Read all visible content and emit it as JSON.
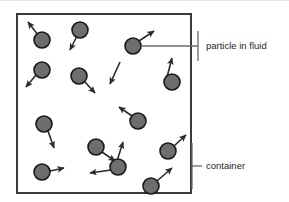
{
  "figure": {
    "colors": {
      "container_stroke": "#3a3a3a",
      "particle_fill": "#6e6e6e",
      "particle_stroke": "#1a1a1a",
      "arrow_stroke": "#2b2b2b",
      "callout_stroke": "#6a6a6a",
      "label_text": "#231f20",
      "background": "#ffffff"
    },
    "container": {
      "x": 16,
      "y": 13,
      "width": 176,
      "height": 181,
      "stroke_width": 2
    }
  },
  "labels": [
    {
      "id": "particle-in-fluid",
      "text": "particle in fluid",
      "x": 206,
      "y": 46
    },
    {
      "id": "container",
      "text": "container",
      "x": 206,
      "y": 166
    }
  ],
  "callouts": [
    {
      "id": "particle-callout",
      "points": "141,46 198,46",
      "tick": "198,31 198,61"
    },
    {
      "id": "container-callout",
      "points": "192,166 202,166",
      "tick": "192,143 192,189"
    }
  ],
  "particles": [
    {
      "id": "p1",
      "cx": 42,
      "cy": 40,
      "r": 8
    },
    {
      "id": "p2",
      "cx": 80,
      "cy": 30,
      "r": 8
    },
    {
      "id": "p3",
      "cx": 42,
      "cy": 70,
      "r": 8
    },
    {
      "id": "p4",
      "cx": 79,
      "cy": 76,
      "r": 8
    },
    {
      "id": "p5",
      "cx": 133,
      "cy": 46,
      "r": 8
    },
    {
      "id": "p6",
      "cx": 172,
      "cy": 82,
      "r": 8
    },
    {
      "id": "p7",
      "cx": 138,
      "cy": 121,
      "r": 8
    },
    {
      "id": "p8",
      "cx": 44,
      "cy": 124,
      "r": 8
    },
    {
      "id": "p9",
      "cx": 96,
      "cy": 147,
      "r": 8
    },
    {
      "id": "p10",
      "cx": 118,
      "cy": 167,
      "r": 8
    },
    {
      "id": "p11",
      "cx": 168,
      "cy": 151,
      "r": 8
    },
    {
      "id": "p12",
      "cx": 151,
      "cy": 186,
      "r": 8
    },
    {
      "id": "p13",
      "cx": 42,
      "cy": 172,
      "r": 8
    }
  ],
  "velocity_arrows": [
    {
      "id": "v1",
      "x1": 38,
      "y1": 35,
      "x2": 28,
      "y2": 22
    },
    {
      "id": "v2",
      "x1": 77,
      "y1": 36,
      "x2": 70,
      "y2": 50
    },
    {
      "id": "v3",
      "x1": 36,
      "y1": 75,
      "x2": 26,
      "y2": 87
    },
    {
      "id": "v4",
      "x1": 85,
      "y1": 82,
      "x2": 95,
      "y2": 93
    },
    {
      "id": "v5",
      "x1": 139,
      "y1": 41,
      "x2": 154,
      "y2": 31
    },
    {
      "id": "v6",
      "x1": 167,
      "y1": 77,
      "x2": 172,
      "y2": 58
    },
    {
      "id": "v7",
      "x1": 132,
      "y1": 116,
      "x2": 119,
      "y2": 107
    },
    {
      "id": "v8",
      "x1": 48,
      "y1": 131,
      "x2": 54,
      "y2": 148
    },
    {
      "id": "v9",
      "x1": 102,
      "y1": 152,
      "x2": 115,
      "y2": 161
    },
    {
      "id": "v10",
      "x1": 117,
      "y1": 161,
      "x2": 123,
      "y2": 142
    },
    {
      "id": "v11",
      "x1": 111,
      "y1": 170,
      "x2": 90,
      "y2": 173
    },
    {
      "id": "v12",
      "x1": 174,
      "y1": 146,
      "x2": 186,
      "y2": 135
    },
    {
      "id": "v13",
      "x1": 157,
      "y1": 181,
      "x2": 172,
      "y2": 168
    },
    {
      "id": "v14",
      "x1": 50,
      "y1": 171,
      "x2": 64,
      "y2": 168
    },
    {
      "id": "v15",
      "x1": 120,
      "y1": 62,
      "x2": 110,
      "y2": 84
    }
  ]
}
